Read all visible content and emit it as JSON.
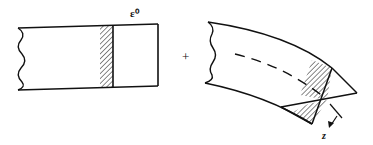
{
  "figure": {
    "left_panel": {
      "label": "ε⁰",
      "description": "straight beam segment with hatched cross-section band"
    },
    "operator": "+",
    "right_panel": {
      "label": "z",
      "description": "curved beam segment with dashed neutral axis and rotated hatched cross-section"
    },
    "colors": {
      "stroke": "#111111",
      "background": "#ffffff"
    }
  }
}
